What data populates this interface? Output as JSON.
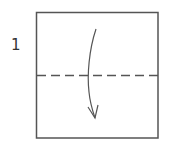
{
  "step": {
    "number": "1"
  },
  "diagram": {
    "paper": {
      "x": 36,
      "y": 12,
      "width": 122,
      "height": 126,
      "stroke": "#555555"
    },
    "fold_line": {
      "type": "valley-fold",
      "y": 75,
      "x1": 37,
      "x2": 158,
      "dash": "9 5",
      "stroke": "#555555"
    },
    "arrow": {
      "direction": "down",
      "meaning": "fold top half down",
      "stroke": "#555555"
    }
  }
}
